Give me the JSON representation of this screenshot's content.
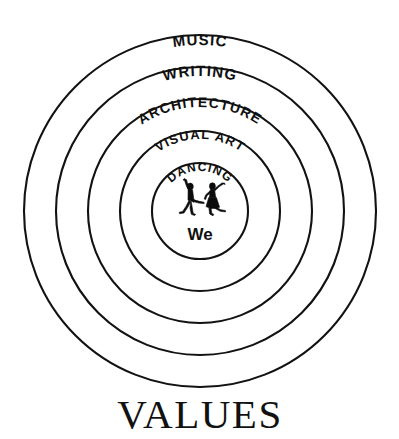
{
  "diagram": {
    "type": "concentric-circles",
    "title": "VALUES",
    "center_label": "We",
    "center_icon": "dancing-couple-icon",
    "background_color": "#ffffff",
    "line_color": "#121212",
    "center": {
      "x": 200,
      "y": 211
    },
    "rings": [
      {
        "index": 1,
        "label": "MUSIC",
        "radius": 176,
        "label_font_size": 15,
        "label_arc_offset": 10,
        "curved": false
      },
      {
        "index": 2,
        "label": "WRITING",
        "radius": 144,
        "label_font_size": 15,
        "label_arc_offset": 9,
        "curved": true
      },
      {
        "index": 3,
        "label": "ARCHITECTURE",
        "radius": 112,
        "label_font_size": 14,
        "label_arc_offset": 8,
        "curved": true
      },
      {
        "index": 4,
        "label": "VISUAL ART",
        "radius": 80,
        "label_font_size": 13,
        "label_arc_offset": 8,
        "curved": true
      },
      {
        "index": 5,
        "label": "DANCING",
        "radius": 48,
        "label_font_size": 12,
        "label_arc_offset": 8,
        "curved": true
      }
    ]
  }
}
